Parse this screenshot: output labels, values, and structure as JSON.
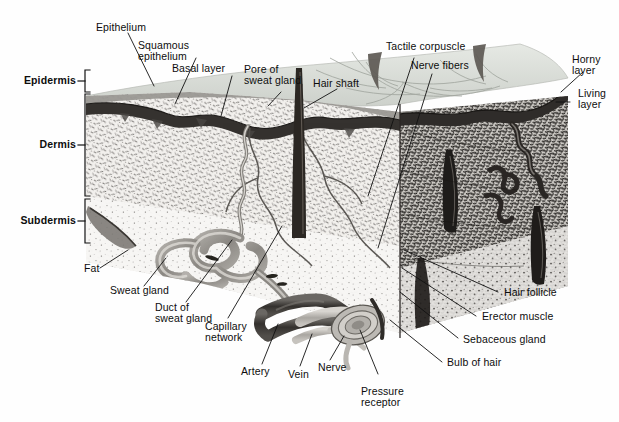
{
  "figure": {
    "palette": {
      "ink": "#0d0d0d",
      "leader": "#111111",
      "horny_layer": "#8d8d8d",
      "living_layer": "#3a3a3a",
      "dermis_left": "#d8d6d2",
      "dermis_right": "#6f6d6a",
      "subdermis": "#efeeec",
      "top_surface": "#d9dcd7",
      "hair": "#2b2724",
      "vessel_dark": "#3d3a37",
      "vessel_light": "#b9b6b1",
      "background": "#fefefe"
    }
  },
  "layer_brackets": [
    {
      "label": "Epidermis",
      "top": 70,
      "bottom": 92
    },
    {
      "label": "Dermis",
      "top": 94,
      "bottom": 196
    },
    {
      "label": "Subdermis",
      "top": 199,
      "bottom": 243
    }
  ],
  "labels": {
    "epithelium": {
      "lines": [
        "Epithelium"
      ]
    },
    "squamous": {
      "lines": [
        "Squamous",
        "epithelium"
      ]
    },
    "basal_layer": {
      "lines": [
        "Basal layer"
      ]
    },
    "pore_sweat_gland": {
      "lines": [
        "Pore of",
        "sweat gland"
      ]
    },
    "hair_shaft": {
      "lines": [
        "Hair shaft"
      ]
    },
    "tactile_corpuscle": {
      "lines": [
        "Tactile corpuscle"
      ]
    },
    "nerve_fibers": {
      "lines": [
        "Nerve fibers"
      ]
    },
    "horny_layer": {
      "lines": [
        "Horny",
        "layer"
      ]
    },
    "living_layer": {
      "lines": [
        "Living",
        "layer"
      ]
    },
    "fat": {
      "lines": [
        "Fat"
      ]
    },
    "sweat_gland": {
      "lines": [
        "Sweat gland"
      ]
    },
    "duct_sweat_gland": {
      "lines": [
        "Duct of",
        "sweat gland"
      ]
    },
    "capillary_network": {
      "lines": [
        "Capillary",
        "network"
      ]
    },
    "artery": {
      "lines": [
        "Artery"
      ]
    },
    "vein": {
      "lines": [
        "Vein"
      ]
    },
    "nerve": {
      "lines": [
        "Nerve"
      ]
    },
    "pressure_receptor": {
      "lines": [
        "Pressure",
        "receptor"
      ]
    },
    "hair_follicle": {
      "lines": [
        "Hair follicle"
      ]
    },
    "erector_muscle": {
      "lines": [
        "Erector muscle"
      ]
    },
    "sebaceous_gland": {
      "lines": [
        "Sebaceous gland"
      ]
    },
    "bulb_of_hair": {
      "lines": [
        "Bulb of hair"
      ]
    }
  }
}
